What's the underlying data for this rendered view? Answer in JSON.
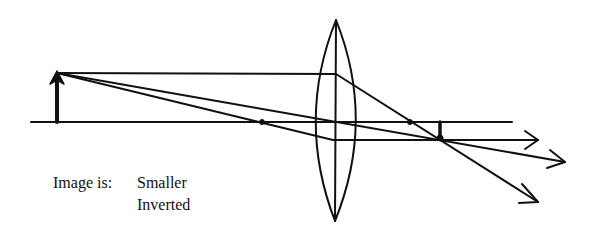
{
  "diagram": {
    "caption": {
      "label": "Image is:",
      "properties": [
        "Smaller",
        "Inverted"
      ]
    },
    "colors": {
      "background": "#ffffff",
      "stroke": "#111111"
    },
    "elements": {
      "optical_axis": {
        "x1": 31,
        "y1": 122,
        "x2": 512,
        "y2": 122
      },
      "lens": {
        "cx": 336,
        "top": 20,
        "bottom": 221,
        "half_width": 20
      },
      "object_arrow": {
        "x": 57,
        "base_y": 122,
        "tip_y": 73
      },
      "image_arrow": {
        "x": 440,
        "base_y": 122,
        "tip_y": 139
      },
      "focal_points": [
        {
          "x": 262,
          "y": 122
        },
        {
          "x": 410,
          "y": 122
        }
      ],
      "rays": [
        {
          "name": "parallel-ray",
          "points": [
            [
              57,
              73
            ],
            [
              336,
              74
            ],
            [
              538,
              202
            ]
          ]
        },
        {
          "name": "center-ray",
          "points": [
            [
              57,
              73
            ],
            [
              565,
              162
            ]
          ]
        },
        {
          "name": "focal-ray",
          "points": [
            [
              57,
              73
            ],
            [
              333,
              140
            ],
            [
              538,
              140
            ]
          ]
        }
      ]
    }
  }
}
